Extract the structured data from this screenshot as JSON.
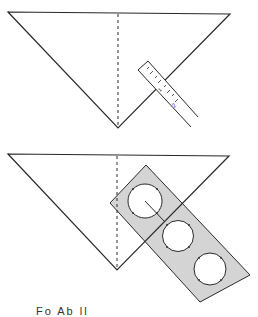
{
  "figure": {
    "top_panel": {
      "description": "Triangle with dashed center fold line and a ruler placed across the right edge",
      "ruler": {
        "tick_labels": [
          "1",
          "2"
        ]
      }
    },
    "bottom_panel": {
      "description": "Same triangle with a gray circle template (three circular holes) laid across the right edge"
    },
    "colors": {
      "line": "#2a2a2a",
      "template_fill": "#d4d4d4",
      "background": "#ffffff"
    },
    "caption": "Fo    Ab   ll"
  }
}
